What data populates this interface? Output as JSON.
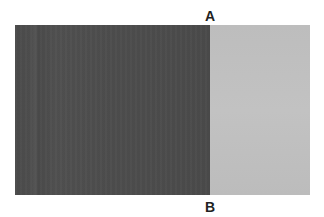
{
  "labels": {
    "top": "A",
    "bottom": "B"
  },
  "panels": {
    "left_color": "#4d4d4d",
    "right_color": "#bfbfbf"
  }
}
